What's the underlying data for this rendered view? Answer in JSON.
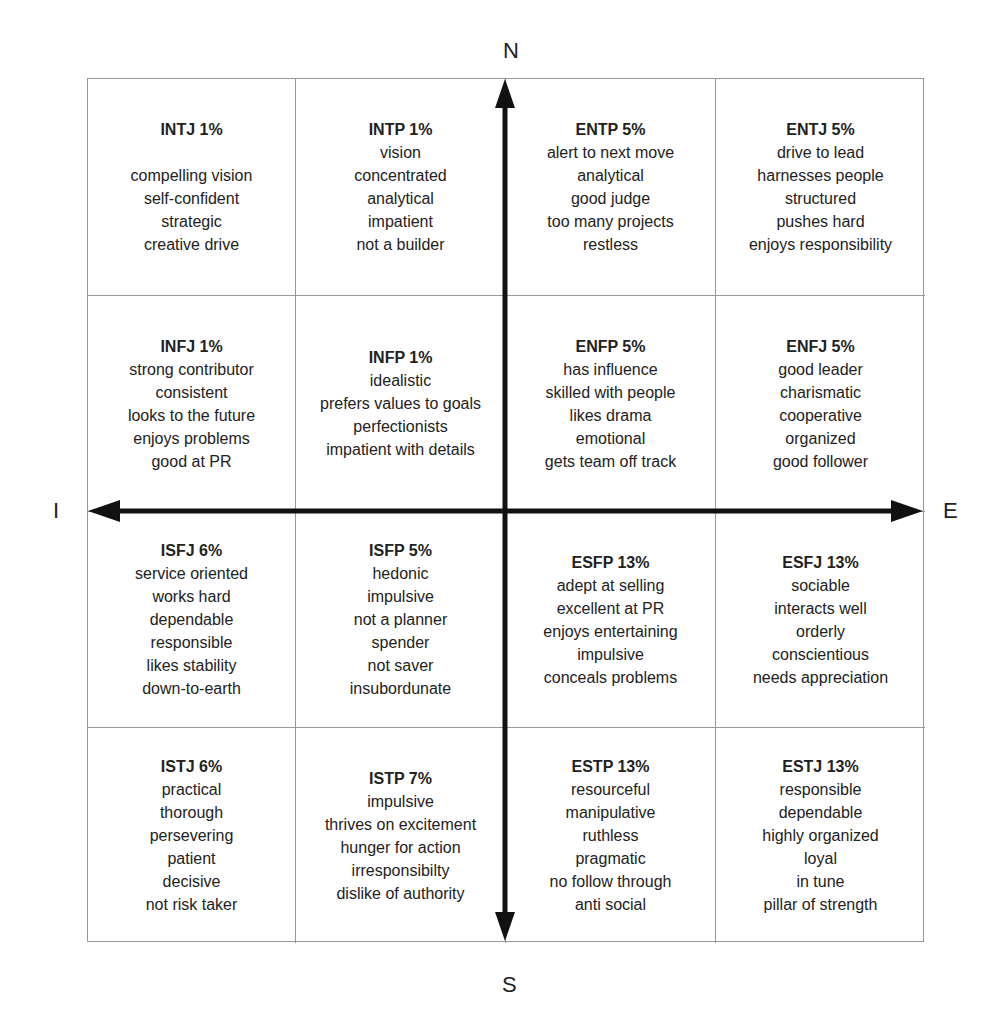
{
  "axes": {
    "top": "N",
    "bottom": "S",
    "left": "I",
    "right": "E",
    "color": "#111111"
  },
  "cells": [
    {
      "type": "INTJ",
      "pct": "1%",
      "title": "INTJ 1%",
      "gap": true,
      "traits": [
        "compelling vision",
        "self-confident",
        "strategic",
        "creative drive"
      ]
    },
    {
      "type": "INTP",
      "pct": "1%",
      "title": "INTP 1%",
      "gap": false,
      "traits": [
        "vision",
        "concentrated",
        "analytical",
        "impatient",
        "not a builder"
      ]
    },
    {
      "type": "ENTP",
      "pct": "5%",
      "title": "ENTP 5%",
      "gap": false,
      "traits": [
        "alert to next move",
        "analytical",
        "good judge",
        "too many projects",
        "restless"
      ]
    },
    {
      "type": "ENTJ",
      "pct": "5%",
      "title": "ENTJ 5%",
      "gap": false,
      "traits": [
        "drive to lead",
        "harnesses people",
        "structured",
        "pushes hard",
        "enjoys responsibility"
      ]
    },
    {
      "type": "INFJ",
      "pct": "1%",
      "title": "INFJ 1%",
      "gap": false,
      "traits": [
        "strong contributor",
        "consistent",
        "looks to the future",
        "enjoys problems",
        "good at PR"
      ]
    },
    {
      "type": "INFP",
      "pct": "1%",
      "title": "INFP 1%",
      "gap": false,
      "traits": [
        "idealistic",
        "prefers values to goals",
        "perfectionists",
        "impatient with details"
      ]
    },
    {
      "type": "ENFP",
      "pct": "5%",
      "title": "ENFP 5%",
      "gap": false,
      "traits": [
        "has influence",
        "skilled with people",
        "likes drama",
        "emotional",
        "gets team off track"
      ]
    },
    {
      "type": "ENFJ",
      "pct": "5%",
      "title": "ENFJ 5%",
      "gap": false,
      "traits": [
        "good leader",
        "charismatic",
        "cooperative",
        "organized",
        "good follower"
      ]
    },
    {
      "type": "ISFJ",
      "pct": "6%",
      "title": "ISFJ 6%",
      "gap": false,
      "traits": [
        "service oriented",
        "works hard",
        "dependable",
        "responsible",
        "likes stability",
        "down-to-earth"
      ]
    },
    {
      "type": "ISFP",
      "pct": "5%",
      "title": "ISFP 5%",
      "gap": false,
      "traits": [
        "hedonic",
        "impulsive",
        "not a planner",
        "spender",
        "not saver",
        "insubordunate"
      ]
    },
    {
      "type": "ESFP",
      "pct": "13%",
      "title": "ESFP 13%",
      "gap": false,
      "traits": [
        "adept at selling",
        "excellent at PR",
        "enjoys entertaining",
        "impulsive",
        "conceals problems"
      ]
    },
    {
      "type": "ESFJ",
      "pct": "13%",
      "title": "ESFJ 13%",
      "gap": false,
      "traits": [
        "sociable",
        "interacts well",
        "orderly",
        "conscientious",
        "needs appreciation"
      ]
    },
    {
      "type": "ISTJ",
      "pct": "6%",
      "title": "ISTJ 6%",
      "gap": false,
      "traits": [
        "practical",
        "thorough",
        "persevering",
        "patient",
        "decisive",
        "not risk taker"
      ]
    },
    {
      "type": "ISTP",
      "pct": "7%",
      "title": "ISTP 7%",
      "gap": false,
      "traits": [
        "impulsive",
        "thrives on excitement",
        "hunger for action",
        "irresponsibilty",
        "dislike of authority"
      ]
    },
    {
      "type": "ESTP",
      "pct": "13%",
      "title": "ESTP 13%",
      "gap": false,
      "traits": [
        "resourceful",
        "manipulative",
        "ruthless",
        "pragmatic",
        "no follow through",
        "anti social"
      ]
    },
    {
      "type": "ESTJ",
      "pct": "13%",
      "title": "ESTJ 13%",
      "gap": false,
      "traits": [
        "responsible",
        "dependable",
        "highly organized",
        "loyal",
        "in tune",
        "pillar of strength"
      ]
    }
  ]
}
